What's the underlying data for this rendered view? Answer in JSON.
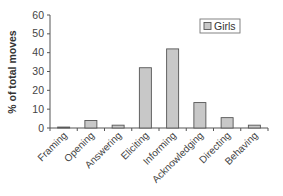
{
  "chart_data": {
    "type": "bar",
    "title": "",
    "xlabel": "",
    "ylabel": "% of total moves",
    "ylim": [
      0,
      60
    ],
    "yticks": [
      0,
      10,
      20,
      30,
      40,
      50,
      60
    ],
    "grid": false,
    "legend_position": "upper right",
    "categories": [
      "Framing",
      "Opening",
      "Answering",
      "Eliciting",
      "Informing",
      "Acknowledging",
      "Directing",
      "Behaving"
    ],
    "series": [
      {
        "name": "Girls",
        "color": "#c8c8c8",
        "values": [
          0.5,
          4,
          1.5,
          32,
          42,
          13.5,
          5.5,
          1.5
        ]
      }
    ]
  }
}
